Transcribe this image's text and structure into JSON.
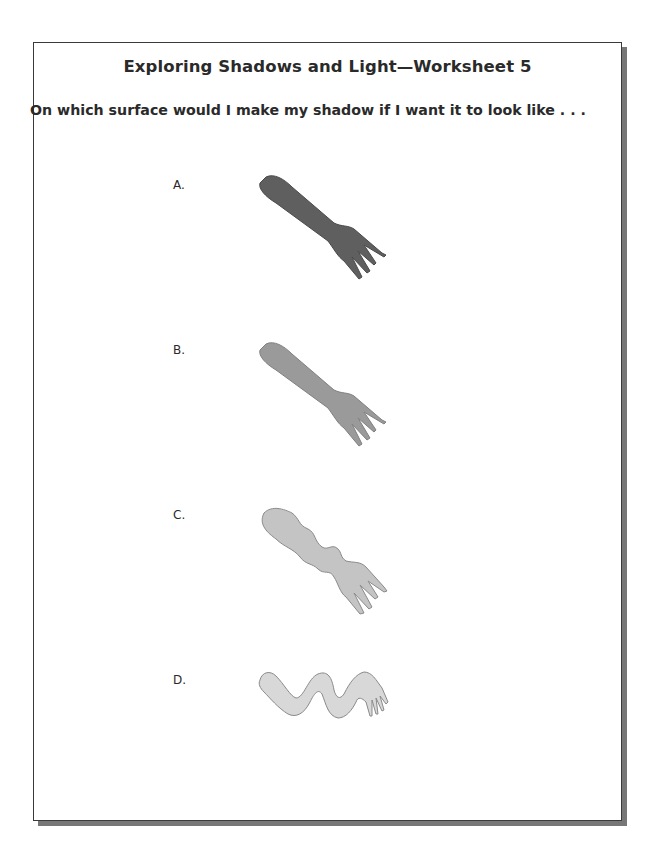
{
  "worksheet": {
    "title": "Exploring Shadows and Light—Worksheet 5",
    "question": "On which surface would I make my shadow if I want it to look like . . .",
    "options": [
      {
        "label": "A.",
        "description": "sharp dark fork shadow",
        "fill": "#5f5f5f"
      },
      {
        "label": "B.",
        "description": "sharp medium gray fork shadow",
        "fill": "#9a9a9a"
      },
      {
        "label": "C.",
        "description": "light wavy-edged fork shadow",
        "fill": "#c4c4c4"
      },
      {
        "label": "D.",
        "description": "very light wiggly distorted fork shadow",
        "fill": "#d8d8d8"
      }
    ]
  }
}
